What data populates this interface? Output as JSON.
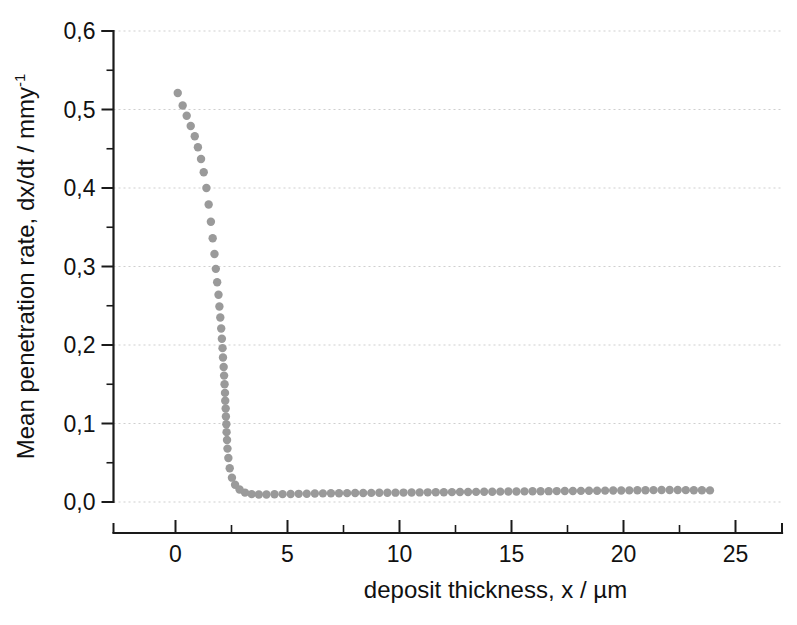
{
  "figure": {
    "background": "#ffffff",
    "marker_color": "#9a9a9a",
    "axis_color": "#1a1a1a",
    "grid_color": "#cfcfcf"
  },
  "chart_data": {
    "type": "scatter",
    "title": "",
    "xlabel": "deposit thickness, x / µm",
    "ylabel": "Mean penetration rate, dx/dt / mmy",
    "ylabel_superscript": "-1",
    "xlim": [
      -1.5,
      27.5
    ],
    "ylim": [
      -0.045,
      0.62
    ],
    "grid": true,
    "grid_axis": "y",
    "legend": "none",
    "xticks": [
      0,
      5,
      10,
      15,
      20,
      25
    ],
    "xticklabels": [
      "0",
      "5",
      "10",
      "15",
      "20",
      "25"
    ],
    "xminorticks": [
      2.5,
      7.5,
      12.5,
      17.5,
      22.5
    ],
    "yticks": [
      0.0,
      0.1,
      0.2,
      0.3,
      0.4,
      0.5,
      0.6
    ],
    "yticklabels": [
      "0,0",
      "0,1",
      "0,2",
      "0,3",
      "0,4",
      "0,5",
      "0,6"
    ],
    "yminorticks": [
      0.05,
      0.15,
      0.25,
      0.35,
      0.45,
      0.55
    ],
    "series": [
      {
        "name": "mean penetration rate",
        "marker": "circle",
        "marker_size": 6,
        "color": "#9a9a9a",
        "x": [
          0.1,
          0.32,
          0.5,
          0.68,
          0.86,
          1.0,
          1.14,
          1.26,
          1.38,
          1.48,
          1.58,
          1.66,
          1.74,
          1.8,
          1.86,
          1.92,
          1.96,
          2.0,
          2.04,
          2.07,
          2.1,
          2.12,
          2.15,
          2.17,
          2.19,
          2.21,
          2.22,
          2.24,
          2.25,
          2.27,
          2.28,
          2.3,
          2.32,
          2.36,
          2.42,
          2.52,
          2.66,
          2.86,
          3.1,
          3.4,
          3.72,
          4.06,
          4.42,
          4.78,
          5.14,
          5.5,
          5.86,
          6.22,
          6.58,
          6.94,
          7.3,
          7.66,
          8.02,
          8.38,
          8.74,
          9.1,
          9.46,
          9.82,
          10.18,
          10.54,
          10.9,
          11.26,
          11.62,
          11.98,
          12.34,
          12.7,
          13.06,
          13.42,
          13.78,
          14.14,
          14.5,
          14.86,
          15.22,
          15.58,
          15.94,
          16.3,
          16.66,
          17.02,
          17.38,
          17.74,
          18.1,
          18.46,
          18.82,
          19.18,
          19.54,
          19.9,
          20.26,
          20.62,
          20.98,
          21.34,
          21.7,
          22.06,
          22.42,
          22.78,
          23.14,
          23.5,
          23.86
        ],
        "y": [
          0.521,
          0.505,
          0.492,
          0.479,
          0.466,
          0.452,
          0.437,
          0.42,
          0.4,
          0.379,
          0.357,
          0.336,
          0.316,
          0.297,
          0.28,
          0.264,
          0.249,
          0.235,
          0.221,
          0.208,
          0.196,
          0.184,
          0.172,
          0.161,
          0.15,
          0.139,
          0.129,
          0.119,
          0.109,
          0.099,
          0.089,
          0.079,
          0.068,
          0.056,
          0.043,
          0.031,
          0.022,
          0.016,
          0.012,
          0.01,
          0.0095,
          0.0095,
          0.0098,
          0.01,
          0.0102,
          0.0104,
          0.0106,
          0.0108,
          0.011,
          0.0111,
          0.0112,
          0.0113,
          0.0114,
          0.0115,
          0.0116,
          0.0117,
          0.0118,
          0.0119,
          0.012,
          0.0121,
          0.0122,
          0.0123,
          0.0124,
          0.0125,
          0.0126,
          0.0127,
          0.0128,
          0.0129,
          0.013,
          0.0131,
          0.0132,
          0.0133,
          0.0134,
          0.0135,
          0.0136,
          0.0137,
          0.0138,
          0.0139,
          0.014,
          0.0141,
          0.0142,
          0.0143,
          0.0144,
          0.0145,
          0.0146,
          0.0147,
          0.0148,
          0.0149,
          0.015,
          0.0151,
          0.0152,
          0.0153,
          0.0152,
          0.0151,
          0.015,
          0.0149,
          0.0148
        ]
      }
    ]
  }
}
